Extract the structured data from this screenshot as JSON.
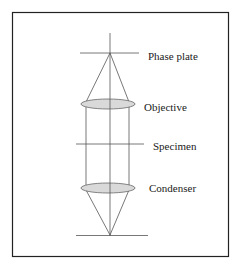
{
  "diagram": {
    "labels": {
      "phase_plate": "Phase plate",
      "objective": "Objective",
      "specimen": "Specimen",
      "condenser": "Condenser"
    },
    "colors": {
      "frame": "#222222",
      "lines": "#555555",
      "lens_fill": "#d9d9d9",
      "lens_stroke": "#666666",
      "text": "#1a1a1a"
    }
  }
}
